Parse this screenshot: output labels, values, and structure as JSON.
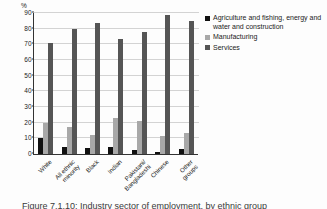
{
  "chart_data": {
    "type": "bar",
    "title": "",
    "xlabel": "",
    "ylabel": "%",
    "ylim": [
      0,
      90
    ],
    "ytick_step": 10,
    "yticks": [
      0,
      10,
      20,
      30,
      40,
      50,
      60,
      70,
      80,
      90
    ],
    "grid": true,
    "legend_position": "right",
    "categories": [
      "White",
      "All ethnic\nminority",
      "Black",
      "Indian",
      "Pakistani/\nBangladeshi",
      "Chinese",
      "Other\ngroups"
    ],
    "series": [
      {
        "name": "Agriculture and fishing, energy and water and construction",
        "color": "#111111",
        "values": [
          10,
          4.5,
          4,
          4.2,
          2.6,
          1.2,
          3
        ]
      },
      {
        "name": "Manufacturing",
        "color": "#a8a8a8",
        "values": [
          19.8,
          17,
          12.3,
          23.3,
          21.2,
          11.2,
          13.6
        ]
      },
      {
        "name": "Services",
        "color": "#555555",
        "values": [
          71,
          79.5,
          83.5,
          73.3,
          77.6,
          88.7,
          84.8
        ]
      }
    ]
  },
  "axis": {
    "unit_label": "%"
  },
  "legend": {
    "items": [
      {
        "label": "Agriculture and fishing, energy and water and construction",
        "swatch": "black-swatch-icon"
      },
      {
        "label": "Manufacturing",
        "swatch": "light-gray-swatch-icon"
      },
      {
        "label": "Services",
        "swatch": "dark-gray-swatch-icon"
      }
    ]
  },
  "caption": {
    "text": "Figure 7.1.10: Industry sector of employment, by ethnic group"
  },
  "colors": {
    "series_0": "#111111",
    "series_1": "#a8a8a8",
    "series_2": "#555555",
    "gridline": "#d3d3d3",
    "axis": "#333333",
    "background": "#fdfdfd"
  }
}
